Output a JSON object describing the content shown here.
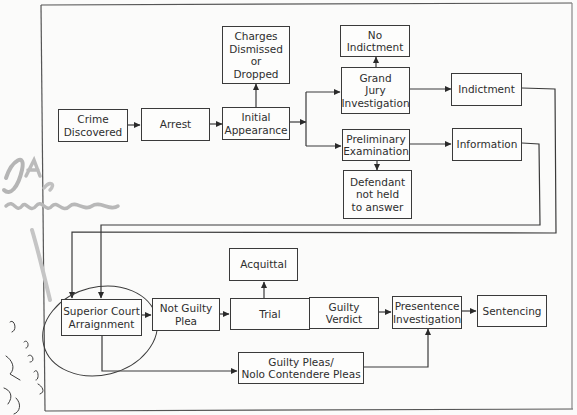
{
  "diagram": {
    "type": "flowchart",
    "title": "",
    "colors": {
      "line": "#3a3a3a",
      "text": "#2e2e2e",
      "background": "#fbfbfa",
      "pencil": "#a8a8a8",
      "pen": "#3c3c3c"
    },
    "nodes": {
      "crime_discovered": "Crime\nDiscovered",
      "arrest": "Arrest",
      "initial_appearance": "Initial\nAppearance",
      "charges_dismissed": "Charges\nDismissed\nor\nDropped",
      "no_indictment": "No\nIndictment",
      "grand_jury": "Grand\nJury\nInvestigation",
      "indictment": "Indictment",
      "preliminary_exam": "Preliminary\nExamination",
      "defendant_not_held": "Defendant\nnot held\nto answer",
      "information": "Information",
      "superior_court": "Superior Court\nArraignment",
      "not_guilty_plea": "Not Guilty\nPlea",
      "trial": "Trial",
      "acquittal": "Acquittal",
      "guilty_verdict": "Guilty\nVerdict",
      "presentence": "Presentence\nInvestigation",
      "sentencing": "Sentencing",
      "guilty_pleas": "Guilty Pleas/\nNolo Contendere Pleas"
    },
    "edges": [
      [
        "Crime Discovered",
        "Arrest"
      ],
      [
        "Arrest",
        "Initial Appearance"
      ],
      [
        "Initial Appearance",
        "Charges Dismissed or Dropped"
      ],
      [
        "Initial Appearance",
        "Grand Jury Investigation"
      ],
      [
        "Initial Appearance",
        "Preliminary Examination"
      ],
      [
        "Grand Jury Investigation",
        "No Indictment"
      ],
      [
        "Grand Jury Investigation",
        "Indictment"
      ],
      [
        "Preliminary Examination",
        "Defendant not held to answer"
      ],
      [
        "Preliminary Examination",
        "Information"
      ],
      [
        "Indictment",
        "Superior Court Arraignment"
      ],
      [
        "Information",
        "Superior Court Arraignment"
      ],
      [
        "Superior Court Arraignment",
        "Not Guilty Plea"
      ],
      [
        "Superior Court Arraignment",
        "Guilty Pleas/Nolo Contendere Pleas"
      ],
      [
        "Not Guilty Plea",
        "Trial"
      ],
      [
        "Trial",
        "Acquittal"
      ],
      [
        "Trial",
        "Guilty Verdict"
      ],
      [
        "Guilty Verdict",
        "Presentence Investigation"
      ],
      [
        "Guilty Pleas/Nolo Contendere Pleas",
        "Presentence Investigation"
      ],
      [
        "Presentence Investigation",
        "Sentencing"
      ]
    ],
    "annotations": {
      "handwritten_note": "handwritten pencil and pen marks in left margin, circle around Superior Court Arraignment"
    }
  }
}
